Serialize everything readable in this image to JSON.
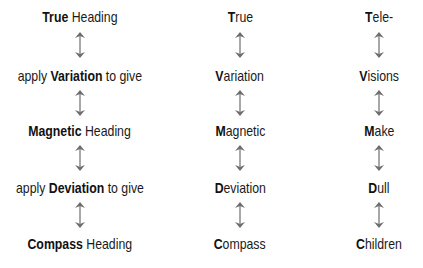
{
  "columns": [
    {
      "name": "full-terms",
      "center_x": 80,
      "rows": [
        {
          "prefix": "",
          "bold": "True",
          "suffix": " Heading"
        },
        {
          "prefix": "apply ",
          "bold": "Variation",
          "suffix": " to give"
        },
        {
          "prefix": "",
          "bold": "Magnetic",
          "suffix": " Heading"
        },
        {
          "prefix": "apply ",
          "bold": "Deviation",
          "suffix": " to give"
        },
        {
          "prefix": "",
          "bold": "Compass",
          "suffix": " Heading"
        }
      ]
    },
    {
      "name": "initial-letters",
      "center_x": 240,
      "rows": [
        {
          "prefix": "",
          "bold": "T",
          "suffix": "rue"
        },
        {
          "prefix": "",
          "bold": "V",
          "suffix": "ariation"
        },
        {
          "prefix": "",
          "bold": "M",
          "suffix": "agnetic"
        },
        {
          "prefix": "",
          "bold": "D",
          "suffix": "eviation"
        },
        {
          "prefix": "",
          "bold": "C",
          "suffix": "ompass"
        }
      ]
    },
    {
      "name": "mnemonic",
      "center_x": 379,
      "rows": [
        {
          "prefix": "",
          "bold": "T",
          "suffix": "ele-"
        },
        {
          "prefix": "",
          "bold": "V",
          "suffix": "isions"
        },
        {
          "prefix": "",
          "bold": "M",
          "suffix": "ake"
        },
        {
          "prefix": "",
          "bold": "D",
          "suffix": "ull"
        },
        {
          "prefix": "",
          "bold": "C",
          "suffix": "hildren"
        }
      ]
    }
  ],
  "arrow_icon": "double-headed-vertical-arrow",
  "arrow_color": "#6e6e6e"
}
